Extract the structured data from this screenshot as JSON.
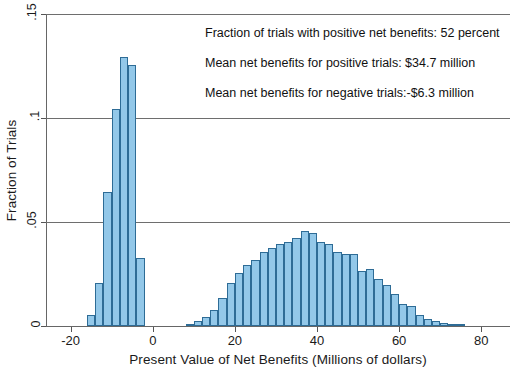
{
  "chart_data": {
    "type": "bar",
    "title": "",
    "subtitle": "",
    "xlabel": "Present Value of Net Benefits (Millions of dollars)",
    "ylabel": "Fraction of Trials",
    "xlim": [
      -26,
      87
    ],
    "ylim": [
      0,
      0.15
    ],
    "xticks": [
      "-20",
      "0",
      "20",
      "40",
      "60",
      "80"
    ],
    "xtick_values": [
      -20,
      0,
      20,
      40,
      60,
      80
    ],
    "yticks": [
      "0",
      ".05",
      ".1",
      ".15"
    ],
    "ytick_values": [
      0,
      0.05,
      0.1,
      0.15
    ],
    "grid": "horizontal",
    "legend": "none",
    "bin_width": 2,
    "bar_color": "#93c8e9",
    "bar_edge_color": "#2e6c96",
    "categories": [
      -15,
      -13,
      -11,
      -9,
      -7,
      -5,
      -3,
      9,
      11,
      13,
      15,
      17,
      19,
      21,
      23,
      25,
      27,
      29,
      31,
      33,
      35,
      37,
      39,
      41,
      43,
      45,
      47,
      49,
      51,
      53,
      55,
      57,
      59,
      61,
      63,
      65,
      67,
      69,
      71,
      73,
      75
    ],
    "values": [
      0.0055,
      0.0205,
      0.0645,
      0.1045,
      0.1295,
      0.1255,
      0.0325,
      0.0012,
      0.0025,
      0.0045,
      0.0075,
      0.0135,
      0.0205,
      0.0255,
      0.0295,
      0.0315,
      0.0355,
      0.0375,
      0.0395,
      0.0405,
      0.0425,
      0.0455,
      0.0445,
      0.0405,
      0.0395,
      0.0355,
      0.0345,
      0.0345,
      0.0265,
      0.0275,
      0.0225,
      0.0195,
      0.0155,
      0.0105,
      0.0095,
      0.0055,
      0.0035,
      0.0022,
      0.0015,
      0.0008,
      0.0005
    ],
    "annotations": [
      "Fraction of trials with positive net benefits: 52 percent",
      "Mean net benefits for positive trials: $34.7 million",
      "Mean net benefits for negative trials:-$6.3 million"
    ]
  }
}
